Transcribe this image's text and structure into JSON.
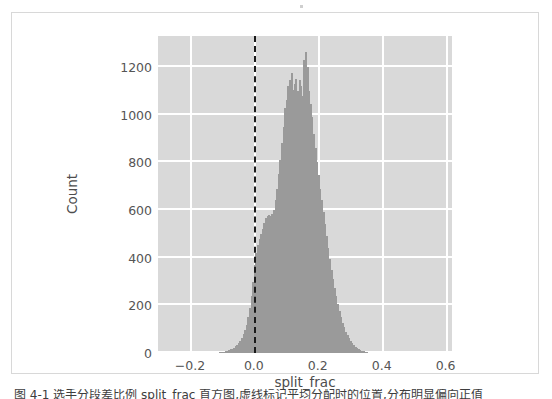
{
  "figure": {
    "caption": "图 4-1 选手分段差比例 split_frac 直方图,虚线标记平均分配时的位置,分布明显偏向正值"
  },
  "chart_data": {
    "type": "bar",
    "title": "",
    "subtitle": "",
    "xlabel": "split_frac",
    "ylabel": "Count",
    "xlim": [
      -0.3,
      0.62
    ],
    "ylim": [
      0,
      1330
    ],
    "grid": true,
    "legend": null,
    "bar_color": "#4c4c4c",
    "bar_edge_color": "#9a9a9a",
    "plot_bg_color": "#d9d9d9",
    "grid_color": "#ffffff",
    "bin_width": 0.005,
    "xticks": [
      -0.2,
      0.0,
      0.2,
      0.4,
      0.6
    ],
    "xtick_labels": [
      "−0.2",
      "0.0",
      "0.2",
      "0.4",
      "0.6"
    ],
    "yticks": [
      0,
      200,
      400,
      600,
      800,
      1000,
      1200
    ],
    "ytick_labels": [
      "0",
      "200",
      "400",
      "600",
      "800",
      "1000",
      "1200"
    ],
    "annotations": [
      {
        "type": "vline",
        "x": 0.0,
        "style": "dashed",
        "color": "#1a1a1a",
        "width": 2,
        "label": "even-split reference"
      }
    ],
    "bins": [
      -0.115,
      -0.11,
      -0.105,
      -0.1,
      -0.095,
      -0.09,
      -0.085,
      -0.08,
      -0.075,
      -0.07,
      -0.065,
      -0.06,
      -0.055,
      -0.05,
      -0.045,
      -0.04,
      -0.035,
      -0.03,
      -0.025,
      -0.02,
      -0.015,
      -0.01,
      -0.005,
      0.0,
      0.005,
      0.01,
      0.015,
      0.02,
      0.025,
      0.03,
      0.035,
      0.04,
      0.045,
      0.05,
      0.055,
      0.06,
      0.065,
      0.07,
      0.075,
      0.08,
      0.085,
      0.09,
      0.095,
      0.1,
      0.105,
      0.11,
      0.115,
      0.12,
      0.125,
      0.13,
      0.135,
      0.14,
      0.145,
      0.15,
      0.155,
      0.16,
      0.165,
      0.17,
      0.175,
      0.18,
      0.185,
      0.19,
      0.195,
      0.2,
      0.205,
      0.21,
      0.215,
      0.22,
      0.225,
      0.23,
      0.235,
      0.24,
      0.245,
      0.25,
      0.255,
      0.26,
      0.265,
      0.27,
      0.275,
      0.28,
      0.285,
      0.29,
      0.295,
      0.3,
      0.305,
      0.31,
      0.315,
      0.32,
      0.325,
      0.33,
      0.335,
      0.34,
      0.345,
      0.35
    ],
    "counts": [
      2,
      3,
      4,
      5,
      6,
      8,
      10,
      12,
      15,
      18,
      22,
      28,
      34,
      42,
      52,
      64,
      78,
      95,
      118,
      150,
      190,
      240,
      300,
      370,
      420,
      455,
      480,
      500,
      520,
      545,
      565,
      575,
      580,
      575,
      585,
      600,
      640,
      690,
      750,
      810,
      880,
      950,
      1030,
      1060,
      1120,
      1145,
      1175,
      1105,
      1130,
      1150,
      1100,
      1145,
      1120,
      1080,
      1230,
      1265,
      1200,
      1100,
      1045,
      990,
      920,
      860,
      800,
      745,
      690,
      640,
      590,
      540,
      490,
      440,
      395,
      350,
      310,
      272,
      238,
      205,
      176,
      150,
      128,
      108,
      90,
      74,
      61,
      50,
      40,
      32,
      26,
      20,
      16,
      12,
      9,
      7,
      5,
      3
    ]
  }
}
